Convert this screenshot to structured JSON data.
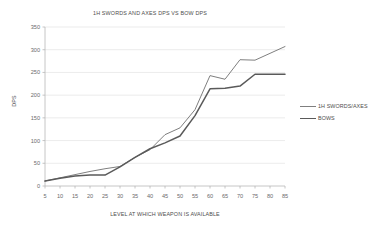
{
  "chart_data": {
    "type": "line",
    "title": "1H SWORDS AND AXES DPS VS BOW DPS",
    "xlabel": "LEVEL AT WHICH WEAPON IS AVAILABLE",
    "ylabel": "DPS",
    "categories": [
      5,
      10,
      15,
      20,
      25,
      30,
      35,
      40,
      45,
      50,
      55,
      60,
      65,
      70,
      75,
      80,
      85
    ],
    "xtick_labels": [
      "5",
      "10",
      "15",
      "20",
      "25",
      "30",
      "35",
      "40",
      "45",
      "50",
      "55",
      "60",
      "65",
      "70",
      "75",
      "80",
      "85"
    ],
    "ytick_labels": [
      "0",
      "50",
      "100",
      "150",
      "200",
      "250",
      "300",
      "350"
    ],
    "yticks": [
      0,
      50,
      100,
      150,
      200,
      250,
      300,
      350
    ],
    "ylim": [
      0,
      350
    ],
    "grid": "horizontal",
    "legend_position": "right",
    "series": [
      {
        "name": "1H SWORDS/AXES",
        "color": "#7f7f7f",
        "line_width": 1.0,
        "values": [
          11,
          18,
          25,
          32,
          38,
          43,
          63,
          80,
          113,
          128,
          168,
          243,
          235,
          278,
          277,
          292,
          307
        ]
      },
      {
        "name": "BOWS",
        "color": "#5a5a5a",
        "line_width": 1.5,
        "values": [
          11,
          17,
          22,
          24,
          24,
          42,
          63,
          82,
          95,
          110,
          155,
          214,
          215,
          220,
          246,
          246,
          246
        ]
      }
    ]
  },
  "plot_geometry": {
    "left": 45,
    "right": 285,
    "top": 27,
    "bottom": 186,
    "gridline_color": "#e3e3e3",
    "axis_color": "#b8b8b8"
  },
  "legend": {
    "items": [
      {
        "label": "1H SWORDS/AXES"
      },
      {
        "label": "BOWS"
      }
    ]
  }
}
